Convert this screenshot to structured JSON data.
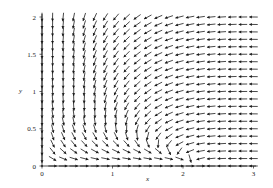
{
  "chart_data": {
    "type": "vector_field",
    "title": "",
    "xlabel": "x",
    "ylabel": "y",
    "xlim": [
      0,
      3
    ],
    "ylim": [
      0,
      2
    ],
    "x_ticks": [
      {
        "value": 0,
        "label": "0"
      },
      {
        "value": 1,
        "label": "1"
      },
      {
        "value": 2,
        "label": "2"
      },
      {
        "value": 3,
        "label": "3"
      }
    ],
    "y_ticks": [
      {
        "value": 0,
        "label": "0"
      },
      {
        "value": 0.5,
        "label": "0.5"
      },
      {
        "value": 1,
        "label": "1"
      },
      {
        "value": 1.5,
        "label": "1.5"
      },
      {
        "value": 2,
        "label": "2"
      }
    ],
    "grid": false,
    "legend": null,
    "arrow_grid": {
      "nx": 21,
      "ny": 21,
      "x_step": 0.15,
      "y_step": 0.1
    },
    "color": "#1a1a1a"
  }
}
